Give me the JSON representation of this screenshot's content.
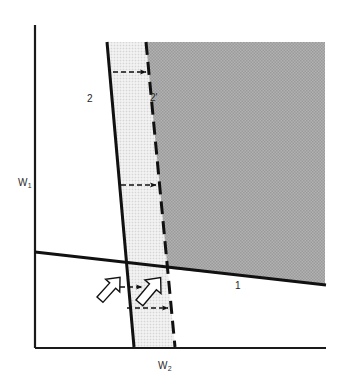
{
  "figure": {
    "type": "diagram",
    "title": "",
    "background_color": "#ffffff"
  },
  "axes": {
    "y_axis": {
      "label": "W",
      "subscript": "1",
      "name": "W1",
      "color": "#1a1a1a",
      "orientation": "vertical"
    },
    "x_axis": {
      "label": "W",
      "subscript": "2",
      "name": "W2",
      "color": "#1a1a1a",
      "orientation": "horizontal"
    }
  },
  "lines": [
    {
      "id": "line-1",
      "label": "1",
      "style": "solid",
      "color": "#111111",
      "slope_description": "shallow negative slope from left axis to right edge"
    },
    {
      "id": "line-2",
      "label": "2",
      "style": "solid",
      "color": "#111111",
      "slope_description": "steep, tilted slightly right going down"
    },
    {
      "id": "line-2-prime",
      "label": "2'",
      "style": "dashed",
      "color": "#111111",
      "slope_description": "steep dashed line parallel to line 2, shifted right"
    }
  ],
  "regions": [
    {
      "id": "transition-band",
      "fill": "#e8e8e8",
      "pattern": "fine-stipple",
      "description": "light stippled band between line 2 and line 2-prime"
    },
    {
      "id": "feasible-region",
      "fill": "#a9a9a9",
      "pattern": "coarse-stipple",
      "description": "darker shaded region right of line 2-prime and above line 1"
    }
  ],
  "annotations": {
    "shift_arrows": [
      {
        "id": "shift-arrow-top",
        "style": "dashed",
        "direction": "right"
      },
      {
        "id": "shift-arrow-middle",
        "style": "dashed",
        "direction": "right"
      },
      {
        "id": "shift-arrow-bottom",
        "style": "dashed",
        "direction": "right"
      }
    ],
    "gradient_arrows": [
      {
        "id": "gradient-arrow-left",
        "style": "outline",
        "direction": "up-right",
        "fill": "#ffffff",
        "stroke": "#111111"
      },
      {
        "id": "gradient-arrow-right",
        "style": "outline",
        "direction": "up-right",
        "fill": "#ffffff",
        "stroke": "#111111"
      }
    ]
  },
  "labels": {
    "w1": "W",
    "w1_sub": "1",
    "w2": "W",
    "w2_sub": "2",
    "line2": "2",
    "line2_prime": "2'",
    "line1": "1"
  }
}
